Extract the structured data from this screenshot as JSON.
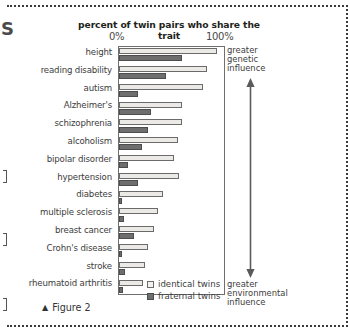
{
  "figure": {
    "caption_marker": "▲",
    "caption": "Figure 2"
  },
  "artifacts": {
    "edge_letter": "S"
  },
  "annotations": {
    "genetic": "greater\ngenetic\ninfluence",
    "genetic_lines": [
      "greater",
      "genetic",
      "influence"
    ],
    "environmental": "greater\nenvironmental\ninfluence",
    "environmental_lines": [
      "greater",
      "environmental",
      "influence"
    ],
    "arrow_name": "double-headed-influence-arrow"
  },
  "chart_data": {
    "type": "bar",
    "orientation": "horizontal",
    "title": "percent of twin pairs who share the trait",
    "xlabel": "",
    "ylabel": "",
    "xlim": [
      0,
      100
    ],
    "xticks": [
      0,
      100
    ],
    "xtick_labels": [
      "0%",
      "100%"
    ],
    "grid": false,
    "legend_position": "bottom-right-inside",
    "categories": [
      "height",
      "reading disability",
      "autism",
      "Alzheimer's",
      "schizophrenia",
      "alcoholism",
      "bipolar disorder",
      "hypertension",
      "diabetes",
      "multiple sclerosis",
      "breast cancer",
      "Crohn's disease",
      "stroke",
      "rheumatoid arthritis"
    ],
    "series": [
      {
        "name": "identical twins",
        "color": "#eceae6",
        "values": [
          93,
          84,
          80,
          60,
          60,
          56,
          52,
          57,
          42,
          37,
          33,
          28,
          25,
          23
        ]
      },
      {
        "name": "fraternal twins",
        "color": "#6e6e6e",
        "values": [
          60,
          45,
          18,
          30,
          28,
          22,
          9,
          18,
          3,
          5,
          14,
          3,
          6,
          4
        ]
      }
    ]
  },
  "legend": [
    {
      "label": "identical twins",
      "swatch": "open-square"
    },
    {
      "label": "fraternal twins",
      "swatch": "filled-square"
    }
  ]
}
